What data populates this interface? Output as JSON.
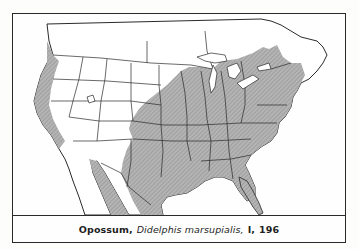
{
  "figure": {
    "type": "range-map",
    "caption": {
      "common_name": "Opossum,",
      "scientific_name": "Didelphis marsupialis,",
      "volume": "I,",
      "page": "196"
    },
    "legend": {
      "shaded_region": "range",
      "shade_color": "#a8a8a8",
      "line_color": "#2a2a2a",
      "background": "#fefefe"
    },
    "regions_shown": [
      "United States",
      "southern Canada",
      "Mexico"
    ],
    "range_description": "Eastern and central United States, Pacific coast strip, southwestern Arizona/New Mexico, and Mexico"
  }
}
